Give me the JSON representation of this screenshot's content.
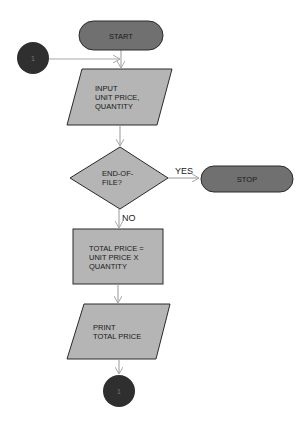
{
  "diagram": {
    "type": "flowchart",
    "colors": {
      "terminator": "#707070",
      "connector": "#2f2f2f",
      "process": "#b5b5b5",
      "arrow": "#a8a8a8",
      "outline": "#2a2a2a"
    },
    "nodes": {
      "start": {
        "label": "START",
        "shape": "terminator"
      },
      "connector_top": {
        "label": "1",
        "shape": "connector"
      },
      "input": {
        "lines": [
          "INPUT",
          "UNIT PRICE,",
          "QUANTITY"
        ],
        "shape": "input-output"
      },
      "decision": {
        "lines": [
          "END-OF-",
          "FILE?"
        ],
        "shape": "decision"
      },
      "stop": {
        "label": "STOP",
        "shape": "terminator"
      },
      "process": {
        "lines": [
          "TOTAL PRICE =",
          "UNIT PRICE X",
          "QUANTITY"
        ],
        "shape": "process"
      },
      "print": {
        "lines": [
          "PRINT",
          "TOTAL PRICE"
        ],
        "shape": "input-output"
      },
      "connector_bottom": {
        "label": "1",
        "shape": "connector"
      }
    },
    "edges": {
      "yes": "YES",
      "no": "NO"
    }
  }
}
